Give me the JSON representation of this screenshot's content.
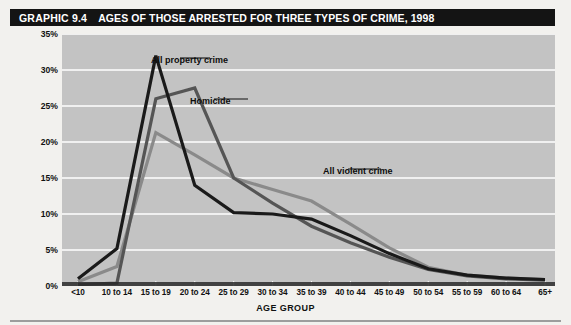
{
  "header": {
    "graphic_number": "GRAPHIC 9.4",
    "title": "AGES OF THOSE ARRESTED FOR THREE TYPES OF CRIME, 1998"
  },
  "colors": {
    "title_bar_bg": "#141414",
    "title_text": "#ffffff",
    "plot_bg": "#c3c3c3",
    "gridline": "#ffffff",
    "page_bg": "#f2f1ee",
    "property_crime": "#1a1a1a",
    "homicide": "#555555",
    "violent_crime": "#8a8a8a"
  },
  "chart_data": {
    "type": "line",
    "title": "AGES OF THOSE ARRESTED FOR THREE TYPES OF CRIME, 1998",
    "xlabel": "AGE GROUP",
    "ylabel": "PERCENTAGE OF ALL ARRESTS FOR EACH TYPE OF CRIME",
    "categories": [
      "<10",
      "10 to 14",
      "15 to 19",
      "20 to 24",
      "25 to 29",
      "30 to 34",
      "35 to 39",
      "40 to 44",
      "45 to 49",
      "50 to 54",
      "55 to 59",
      "60 to 64",
      "65+"
    ],
    "ylim": [
      0,
      35
    ],
    "yticks": [
      0,
      5,
      10,
      15,
      20,
      25,
      30,
      35
    ],
    "ytick_labels": [
      "0%",
      "5%",
      "10%",
      "15%",
      "20%",
      "25%",
      "30%",
      "35%"
    ],
    "grid": true,
    "legend_position": "inline-annotations",
    "series": [
      {
        "name": "All property crime",
        "color": "#1a1a1a",
        "values": [
          1.0,
          5.2,
          32.0,
          14.0,
          10.2,
          10.0,
          9.3,
          7.0,
          4.5,
          2.4,
          1.5,
          1.1,
          0.9
        ]
      },
      {
        "name": "Homicide",
        "color": "#555555",
        "values": [
          0.2,
          0.4,
          26.0,
          27.5,
          15.0,
          11.5,
          8.3,
          6.0,
          4.0,
          2.3,
          1.4,
          1.0,
          0.8
        ]
      },
      {
        "name": "All violent crime",
        "color": "#8a8a8a",
        "values": [
          0.6,
          2.7,
          21.3,
          18.2,
          15.0,
          13.4,
          11.8,
          8.6,
          5.3,
          2.6,
          1.5,
          1.1,
          0.9
        ]
      }
    ],
    "annotations": [
      {
        "text": "All property crime",
        "series": "All property crime"
      },
      {
        "text": "Homicide",
        "series": "Homicide"
      },
      {
        "text": "All violent crime",
        "series": "All violent crime"
      }
    ]
  }
}
